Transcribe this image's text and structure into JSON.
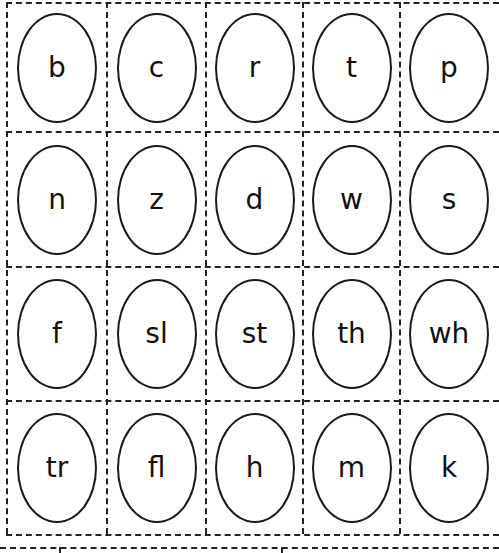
{
  "worksheet": {
    "rows": [
      [
        "b",
        "c",
        "r",
        "t",
        "p"
      ],
      [
        "n",
        "z",
        "d",
        "w",
        "s"
      ],
      [
        "f",
        "sl",
        "st",
        "th",
        "wh"
      ],
      [
        "tr",
        "fl",
        "h",
        "m",
        "k"
      ]
    ]
  },
  "colors": {
    "line": "#222222",
    "text": "#111111",
    "background": "#ffffff"
  }
}
